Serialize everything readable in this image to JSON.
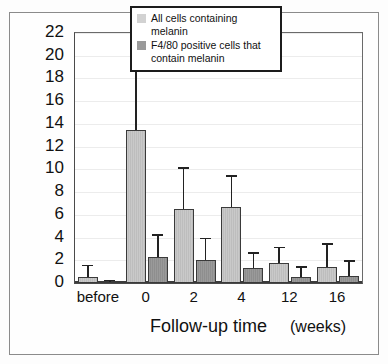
{
  "chart_data": {
    "type": "bar",
    "title": "",
    "xlabel": "Follow-up time",
    "xunits": "(weeks)",
    "ylabel": "Number of cells per field",
    "categories": [
      "before",
      "0",
      "2",
      "4",
      "12",
      "16"
    ],
    "ylim": [
      0,
      22
    ],
    "yticks": [
      "0",
      "2",
      "4",
      "6",
      "8",
      "10",
      "12",
      "14",
      "16",
      "18",
      "20",
      "22"
    ],
    "grid": true,
    "legend_position": "top-right",
    "series": [
      {
        "name": "All cells containing melanin",
        "color": "#c9c9c9",
        "values": [
          0.5,
          13.5,
          6.5,
          6.7,
          1.8,
          1.4
        ],
        "errors_upper": [
          1.6,
          19.0,
          10.2,
          9.5,
          3.2,
          3.5
        ]
      },
      {
        "name": "F4/80 positive cells that contain melanin",
        "color": "#9a9a9a",
        "values": [
          0.1,
          2.3,
          2.0,
          1.3,
          0.5,
          0.6
        ],
        "errors_upper": [
          0.3,
          4.3,
          4.0,
          2.7,
          1.5,
          2.0
        ]
      }
    ]
  },
  "legend": {
    "entry1": "All cells containing melanin",
    "entry2_line1": "F4/80 positive cells that",
    "entry2_line2": "contain melanin"
  }
}
